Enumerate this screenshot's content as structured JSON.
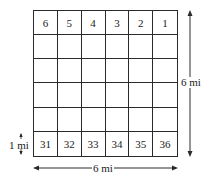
{
  "diagram": {
    "rows": 6,
    "cols": 6,
    "top_row_labels": [
      "6",
      "5",
      "4",
      "3",
      "2",
      "1"
    ],
    "bottom_row_labels": [
      "31",
      "32",
      "33",
      "34",
      "35",
      "36"
    ],
    "height_label": "6 mi",
    "width_label": "6 mi",
    "section_label": "1 mi",
    "line_color": "#2a2a2a"
  }
}
